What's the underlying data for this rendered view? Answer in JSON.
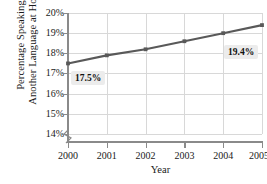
{
  "chart_data": {
    "type": "line",
    "title": "",
    "xlabel": "Year",
    "ylabel_line1": "Percentage Speaking",
    "ylabel_line2": "Another Language at Home",
    "categories": [
      "2000",
      "2001",
      "2002",
      "2003",
      "2004",
      "2005"
    ],
    "x": [
      2000,
      2001,
      2002,
      2003,
      2004,
      2005
    ],
    "values": [
      17.5,
      17.9,
      18.2,
      18.6,
      19.0,
      19.4
    ],
    "ylim": [
      14,
      20
    ],
    "xlim": [
      2000,
      2005
    ],
    "ytick_labels": [
      "20%",
      "19%",
      "18%",
      "17%",
      "16%",
      "15%",
      "14%"
    ],
    "ytick_values": [
      20,
      19,
      18,
      17,
      16,
      15,
      14
    ],
    "xtick_labels": [
      "2000",
      "2001",
      "2002",
      "2003",
      "2004",
      "2005"
    ],
    "grid": true,
    "legend": "none",
    "axis_break": true,
    "annotations": [
      {
        "text": "17.5%",
        "x": 2000,
        "y": 17.5
      },
      {
        "text": "19.4%",
        "x": 2005,
        "y": 19.4
      }
    ],
    "series_color": "#595959",
    "grid_color": "#d8d8d8",
    "axis_color": "#8a8a8a"
  }
}
